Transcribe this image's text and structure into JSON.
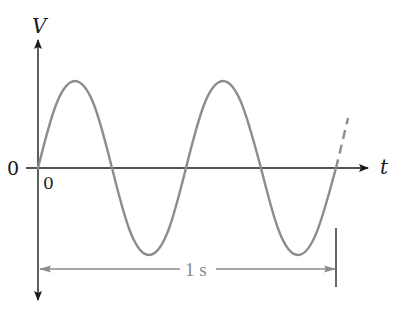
{
  "diagram": {
    "type": "sine-waveform",
    "y_axis_label": "V",
    "x_axis_label": "t",
    "origin_label_left": "0",
    "origin_label_below": "0",
    "period_annotation": "1 s",
    "cycles_shown": 2,
    "continuation": "dashed",
    "colors": {
      "axes": "#1a1a1a",
      "wave": "#8c8c8c",
      "annotation": "#8a8a8a",
      "marker": "#333333"
    }
  }
}
